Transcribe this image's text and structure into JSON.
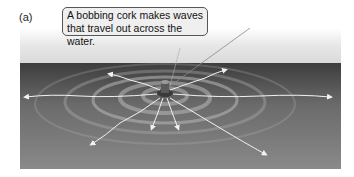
{
  "figure": {
    "panel_label": "(a)",
    "callout": {
      "line1": "A bobbing cork makes waves",
      "line2": "that travel out across the water."
    },
    "elements": [
      "sky",
      "water-surface",
      "cork",
      "concentric-ripples",
      "outward-wave-arrows"
    ],
    "colors": {
      "water_dark": "#3d3d3d",
      "water_light": "#8a8a8a",
      "sky": "#e7e7e7",
      "arrow": "#f2f2f2",
      "callout_bg": "#efefef"
    }
  }
}
